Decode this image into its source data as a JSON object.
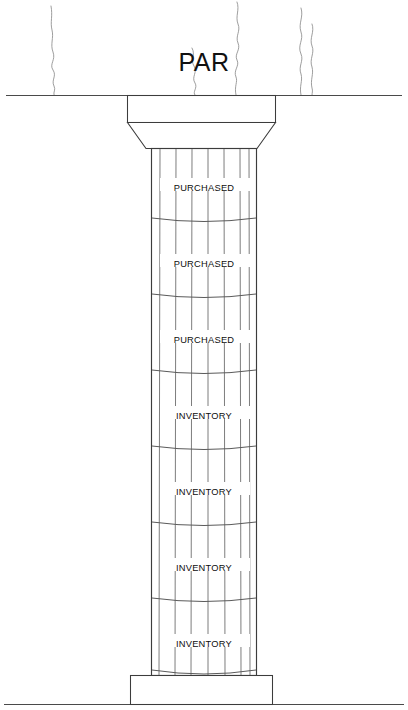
{
  "diagram": {
    "title": "PAR",
    "ground_line_label": "",
    "colors": {
      "ink": "#3c3c3c",
      "label_text": "#0d0d0d",
      "flute": "#6e6e6e",
      "crack": "#8c8c8c",
      "ground": "#4a4a4a",
      "fill": "#ffffff"
    },
    "capital": {
      "abacus_name": "abacus",
      "echinus_name": "echinus"
    },
    "base": {
      "plinth_name": "plinth"
    },
    "shaft": {
      "flute_count": 6,
      "drum_count": 7,
      "drums": [
        {
          "index": 1,
          "label": "PURCHASED"
        },
        {
          "index": 2,
          "label": "PURCHASED"
        },
        {
          "index": 3,
          "label": "PURCHASED"
        },
        {
          "index": 4,
          "label": "INVENTORY"
        },
        {
          "index": 5,
          "label": "INVENTORY"
        },
        {
          "index": 6,
          "label": "INVENTORY"
        },
        {
          "index": 7,
          "label": "INVENTORY"
        }
      ]
    },
    "cracks": {
      "count": 5,
      "name": "crack-line"
    }
  }
}
